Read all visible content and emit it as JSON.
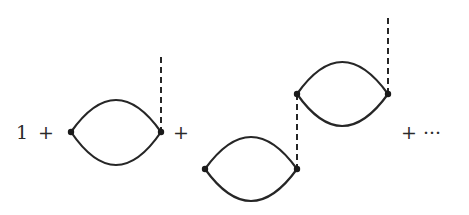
{
  "diagram": {
    "terms": [
      {
        "label": "1"
      },
      {
        "label": "+"
      },
      {
        "label": "+"
      },
      {
        "label": "+ ···"
      }
    ],
    "colors": {
      "line": "#262626",
      "text": "#2a2a2a",
      "background": "#ffffff"
    },
    "elements": {
      "loop1": {
        "left_vertex": [
          71,
          132
        ],
        "right_vertex": [
          161,
          132
        ],
        "external_dashed_top": [
          161,
          57
        ]
      },
      "loop2_lower": {
        "left_vertex": [
          205,
          169
        ],
        "right_vertex": [
          297,
          169
        ]
      },
      "loop2_upper": {
        "left_vertex": [
          297,
          94
        ],
        "right_vertex": [
          388,
          94
        ],
        "external_dashed_top": [
          388,
          18
        ]
      },
      "internal_dashed": {
        "from": [
          297,
          94
        ],
        "to": [
          297,
          169
        ]
      }
    }
  }
}
